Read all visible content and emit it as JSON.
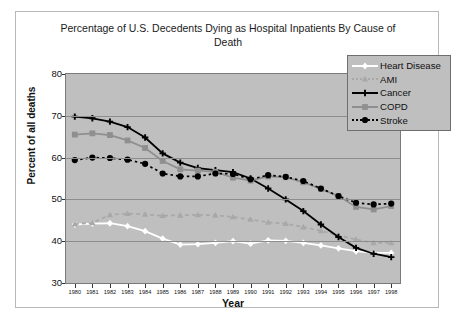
{
  "chart_data": {
    "type": "line",
    "title": "Percentage of U.S. Decedents Dying as Hospital Inpatients By Cause of Death",
    "xlabel": "Year",
    "ylabel": "Percent of all deaths",
    "ylim": [
      30,
      80
    ],
    "yticks": [
      30,
      40,
      50,
      60,
      70,
      80
    ],
    "grid": true,
    "legend_position": "top-right",
    "categories": [
      1980,
      1981,
      1982,
      1983,
      1984,
      1985,
      1986,
      1987,
      1988,
      1989,
      1990,
      1991,
      1992,
      1993,
      1994,
      1995,
      1996,
      1997,
      1998
    ],
    "series": [
      {
        "name": "Heart Disease",
        "color": "#ffffff",
        "marker": "diamond",
        "style": "solid",
        "values": [
          44.0,
          44.2,
          44.3,
          43.6,
          42.4,
          40.6,
          39.2,
          39.3,
          39.6,
          40.0,
          39.4,
          40.2,
          40.1,
          39.6,
          39.0,
          38.3,
          37.6,
          37.2,
          37.2
        ]
      },
      {
        "name": "AMI",
        "color": "#a8a8a8",
        "marker": "triangle",
        "style": "dashed",
        "values": [
          44.1,
          44.4,
          46.3,
          46.6,
          46.4,
          46.1,
          46.2,
          46.3,
          46.2,
          45.8,
          45.2,
          44.5,
          44.2,
          43.4,
          42.5,
          41.4,
          40.4,
          39.6,
          39.6
        ]
      },
      {
        "name": "Cancer",
        "color": "#000000",
        "marker": "plus",
        "style": "solid",
        "values": [
          69.8,
          69.4,
          68.6,
          67.3,
          64.8,
          61.0,
          58.8,
          57.5,
          57.0,
          56.5,
          55.0,
          52.6,
          50.0,
          47.2,
          44.0,
          41.0,
          38.4,
          37.0,
          36.2
        ]
      },
      {
        "name": "COPD",
        "color": "#8f8f8f",
        "marker": "square",
        "style": "solid",
        "values": [
          65.5,
          65.8,
          65.4,
          64.1,
          62.3,
          59.2,
          57.2,
          56.9,
          56.6,
          55.2,
          54.5,
          55.5,
          55.3,
          54.1,
          52.5,
          50.8,
          48.2,
          47.6,
          48.4
        ]
      },
      {
        "name": "Stroke",
        "color": "#000000",
        "marker": "circle",
        "style": "dotted",
        "values": [
          59.4,
          60.0,
          59.9,
          59.5,
          58.5,
          56.2,
          55.5,
          55.5,
          56.2,
          56.1,
          54.8,
          55.8,
          55.4,
          54.4,
          52.6,
          50.8,
          49.2,
          48.8,
          49.0
        ]
      }
    ]
  },
  "legend": {
    "items": [
      {
        "label": "Heart Disease"
      },
      {
        "label": "AMI"
      },
      {
        "label": "Cancer"
      },
      {
        "label": "COPD"
      },
      {
        "label": "Stroke"
      }
    ]
  }
}
